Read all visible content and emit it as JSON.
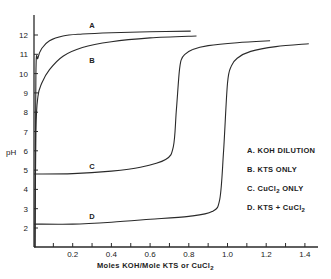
{
  "chart_data": {
    "type": "line",
    "title": "",
    "xlabel": "Moles KOH/Mole KTS or CuCl2",
    "ylabel": "pH",
    "xlim": [
      0,
      1.45
    ],
    "ylim": [
      1,
      13
    ],
    "grid": false,
    "legend_position": "right-center",
    "x_ticks": [
      0.1,
      0.2,
      0.3,
      0.4,
      0.5,
      0.6,
      0.7,
      0.8,
      0.9,
      1.0,
      1.1,
      1.2,
      1.3,
      1.4
    ],
    "x_tick_labels": [
      "0.2",
      "0.4",
      "0.6",
      "0.8",
      "1.0",
      "1.2",
      "1.4"
    ],
    "y_tick_labels": [
      "2",
      "3",
      "4",
      "5",
      "6",
      "7",
      "8",
      "9",
      "10",
      "11",
      "12"
    ],
    "series": [
      {
        "name": "A. KOH DILUTION",
        "label": "A",
        "x": [
          0.005,
          0.01,
          0.02,
          0.04,
          0.08,
          0.15,
          0.25,
          0.4,
          0.6,
          0.81
        ],
        "y": [
          1.0,
          10.0,
          10.8,
          11.3,
          11.7,
          11.95,
          12.05,
          12.12,
          12.17,
          12.2
        ]
      },
      {
        "name": "B. KTS ONLY",
        "label": "B",
        "x": [
          0.005,
          0.01,
          0.02,
          0.04,
          0.08,
          0.15,
          0.25,
          0.4,
          0.6,
          0.84
        ],
        "y": [
          1.0,
          7.0,
          8.8,
          9.5,
          10.2,
          10.9,
          11.35,
          11.65,
          11.85,
          11.95
        ]
      },
      {
        "name": "C. CuCl2 ONLY",
        "label": "C",
        "x": [
          0.0,
          0.2,
          0.4,
          0.55,
          0.68,
          0.72,
          0.735,
          0.75,
          0.76,
          0.78,
          0.82,
          0.9,
          1.05,
          1.22
        ],
        "y": [
          4.8,
          4.82,
          4.95,
          5.15,
          5.55,
          6.2,
          8.0,
          10.0,
          10.7,
          11.0,
          11.25,
          11.45,
          11.6,
          11.7
        ]
      },
      {
        "name": "D. KTS + CuCl2",
        "label": "D",
        "x": [
          0.0,
          0.2,
          0.4,
          0.6,
          0.8,
          0.92,
          0.96,
          0.98,
          1.0,
          1.02,
          1.05,
          1.12,
          1.25,
          1.42
        ],
        "y": [
          2.2,
          2.2,
          2.3,
          2.45,
          2.6,
          2.85,
          3.5,
          6.0,
          9.5,
          10.4,
          10.8,
          11.15,
          11.4,
          11.55
        ]
      }
    ],
    "curve_labels": [
      {
        "text": "A",
        "x": 0.3,
        "y": 12.5
      },
      {
        "text": "B",
        "x": 0.3,
        "y": 10.7
      },
      {
        "text": "C",
        "x": 0.3,
        "y": 5.2
      },
      {
        "text": "D",
        "x": 0.3,
        "y": 2.6
      }
    ]
  },
  "legend": {
    "items": [
      {
        "prefix": "A.",
        "text": "KOH  DILUTION"
      },
      {
        "prefix": "B.",
        "text": "KTS  ONLY"
      },
      {
        "prefix": "C.",
        "text": "CuCl",
        "sub": "2",
        "after": "  ONLY"
      },
      {
        "prefix": "D.",
        "text": "KTS + CuCl",
        "sub": "2",
        "after": ""
      }
    ]
  },
  "axes": {
    "ylabel": "pH",
    "xlabel_main": "Moles KOH/Mole KTS or CuCl",
    "xlabel_sub": "2"
  }
}
